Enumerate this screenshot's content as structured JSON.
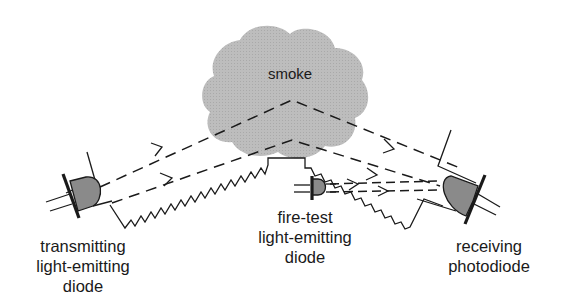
{
  "diagram": {
    "type": "smoke-detector-optical-path",
    "cloud": {
      "label": "smoke",
      "fill": "#bcbcbc"
    },
    "components": [
      {
        "id": "transmitter",
        "label_lines": [
          "transmitting",
          "light-emitting",
          "diode"
        ]
      },
      {
        "id": "fire-test",
        "label_lines": [
          "fire-test",
          "light-emitting",
          "diode"
        ]
      },
      {
        "id": "receiver",
        "label_lines": [
          "receiving",
          "photodiode"
        ]
      }
    ],
    "colors": {
      "line": "#1a1a1a",
      "diode_body": "#8a8a8a",
      "smoke": "#bcbcbc",
      "background": "#ffffff"
    }
  }
}
